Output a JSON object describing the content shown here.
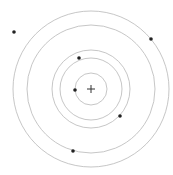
{
  "diagram": {
    "center": {
      "x": 91,
      "y": 89
    },
    "ring_color": "#b8b8b8",
    "dot_color": "#222222",
    "rings": [
      16,
      31,
      39,
      64,
      78
    ],
    "dots": [
      {
        "x": 14,
        "y": 32
      },
      {
        "x": 151,
        "y": 39
      },
      {
        "x": 79,
        "y": 58
      },
      {
        "x": 75,
        "y": 90
      },
      {
        "x": 120,
        "y": 116
      },
      {
        "x": 73,
        "y": 151
      }
    ]
  }
}
